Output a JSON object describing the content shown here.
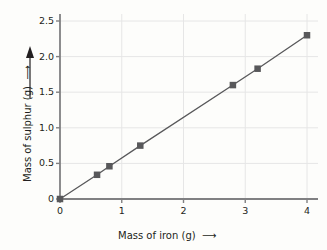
{
  "chart_data": {
    "type": "line",
    "title": "",
    "xlabel": "Mass of iron (g)",
    "ylabel": "Mass of sulphur (g)",
    "xlim": [
      0,
      4
    ],
    "ylim": [
      0,
      2.5
    ],
    "xticks": [
      "0",
      "1",
      "2",
      "3",
      "4"
    ],
    "xtick_values": [
      0,
      1,
      2,
      3,
      4
    ],
    "yticks": [
      "0",
      "0.5",
      "1.0",
      "1.5",
      "2.0",
      "2.5"
    ],
    "ytick_values": [
      0,
      0.5,
      1.0,
      1.5,
      2.0,
      2.5
    ],
    "grid": true,
    "legend": null,
    "x": [
      0,
      0.6,
      0.8,
      1.3,
      2.8,
      3.2,
      4.0
    ],
    "y": [
      0,
      0.34,
      0.46,
      0.75,
      1.6,
      1.83,
      2.3
    ],
    "points": [
      {
        "x": 0,
        "y": 0
      },
      {
        "x": 0.6,
        "y": 0.34
      },
      {
        "x": 0.8,
        "y": 0.46
      },
      {
        "x": 1.3,
        "y": 0.75
      },
      {
        "x": 2.8,
        "y": 1.6
      },
      {
        "x": 3.2,
        "y": 1.83
      },
      {
        "x": 4.0,
        "y": 2.3
      }
    ],
    "marker": "square",
    "marker_color": "#58585a",
    "line_color": "#58585a",
    "grid_color": "#e6e6e6",
    "axis_color": "#808082",
    "text_color": "#231f20",
    "background": "#fdfdfb",
    "x_axis_arrow": "→",
    "y_axis_arrow": "↑"
  },
  "axes": {
    "x_title": "Mass of iron (g)",
    "y_title": "Mass of sulphur (g)"
  }
}
